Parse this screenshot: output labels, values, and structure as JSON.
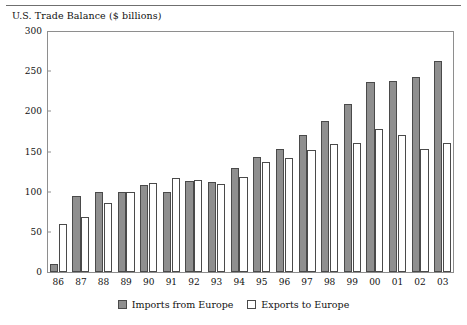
{
  "chart_data": {
    "type": "bar",
    "title": "U.S. Trade Balance ($ billions)",
    "xlabel": "",
    "ylabel": "",
    "ylim": [
      0,
      300
    ],
    "yticks": [
      0,
      50,
      100,
      150,
      200,
      250,
      300
    ],
    "grid": false,
    "legend_position": "bottom-center",
    "categories": [
      "86",
      "87",
      "88",
      "89",
      "90",
      "91",
      "92",
      "93",
      "94",
      "95",
      "96",
      "97",
      "98",
      "99",
      "00",
      "01",
      "02",
      "03"
    ],
    "series": [
      {
        "name": "Imports from Europe",
        "color": "#8f8f8f",
        "values": [
          10,
          95,
          99,
          100,
          108,
          100,
          113,
          112,
          130,
          143,
          153,
          170,
          188,
          209,
          236,
          238,
          243,
          263
        ]
      },
      {
        "name": "Exports to Europe",
        "color": "#ffffff",
        "values": [
          60,
          68,
          86,
          99,
          111,
          117,
          114,
          110,
          118,
          137,
          142,
          152,
          159,
          161,
          178,
          171,
          153,
          161
        ]
      }
    ]
  },
  "legend": {
    "items": [
      {
        "label": "Imports from Europe",
        "swatch": "imports"
      },
      {
        "label": "Exports to Europe",
        "swatch": "exports"
      }
    ]
  }
}
